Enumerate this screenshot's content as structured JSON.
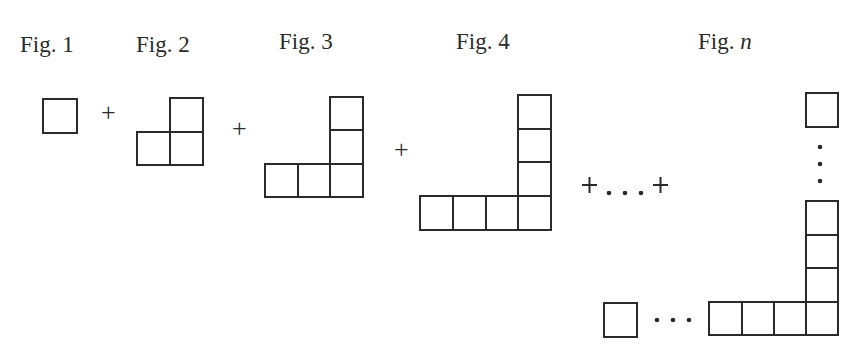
{
  "figures": [
    {
      "label_prefix": "Fig. ",
      "label_index": "1",
      "squares": 1
    },
    {
      "label_prefix": "Fig. ",
      "label_index": "2",
      "squares": 3
    },
    {
      "label_prefix": "Fig. ",
      "label_index": "3",
      "squares": 5
    },
    {
      "label_prefix": "Fig. ",
      "label_index": "4",
      "squares": 7
    },
    {
      "label_prefix": "Fig. ",
      "label_index": "n",
      "squares": "2n-1"
    }
  ],
  "operators": {
    "plus": "+",
    "ellipsis_sum": "+ . . . +",
    "horizontal_dots": "• • •",
    "vertical_dots": "•"
  },
  "style": {
    "line_color": "#2a2a2a",
    "background": "#ffffff"
  }
}
